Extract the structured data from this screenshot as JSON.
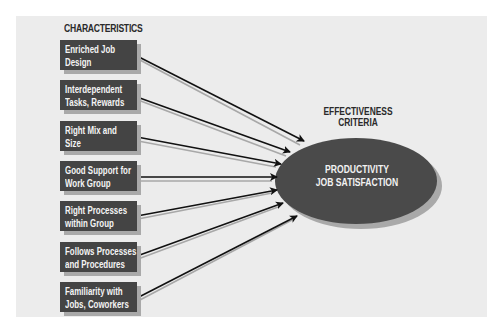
{
  "diagram": {
    "characteristics_title": "CHARACTERISTICS",
    "criteria_title_line1": "EFFECTIVENESS",
    "criteria_title_line2": "CRITERIA",
    "characteristics": [
      {
        "label": "Enriched Job\nDesign"
      },
      {
        "label": "Interdependent\nTasks, Rewards"
      },
      {
        "label": "Right Mix and\nSize"
      },
      {
        "label": "Good Support for\nWork Group"
      },
      {
        "label": "Right Processes\nwithin Group"
      },
      {
        "label": "Follows Processes\nand Procedures"
      },
      {
        "label": "Familiarity with\nJobs, Coworkers"
      }
    ],
    "outcome": {
      "line1": "PRODUCTIVITY",
      "line2": "JOB SATISFACTION"
    },
    "colors": {
      "box_fill": "#444444",
      "ellipse_fill": "#4a4a4a",
      "panel_bg": "#ececec",
      "arrow": "#111111"
    }
  }
}
